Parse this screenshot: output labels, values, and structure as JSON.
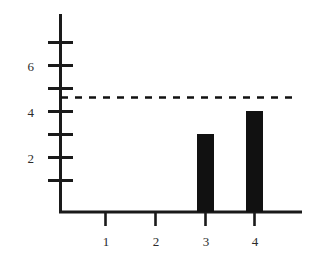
{
  "chart_data": {
    "type": "bar",
    "title": "",
    "subtitle": "",
    "xlabel": "",
    "ylabel": "",
    "categories": [
      "1",
      "2",
      "3",
      "4"
    ],
    "values": [
      6,
      7,
      3,
      4
    ],
    "series": [
      {
        "name": "",
        "values": [
          6,
          7,
          3,
          4
        ],
        "color": "#111111"
      }
    ],
    "ylim": [
      0,
      7.6
    ],
    "xlim": [
      0,
      5
    ],
    "y_ticks": [
      1,
      2,
      3,
      4,
      5,
      6,
      7
    ],
    "y_tick_labels": [
      "",
      "2",
      "",
      "4",
      "",
      "6",
      ""
    ],
    "y_labeled_ticks": [
      {
        "value": 6,
        "label": "6"
      },
      {
        "value": 4,
        "label": "4"
      },
      {
        "value": 2,
        "label": "2"
      }
    ],
    "x_tick_labels": [
      "1",
      "2",
      "3",
      "4"
    ],
    "grid": false,
    "legend": null,
    "legend_position": "none",
    "annotations": [
      {
        "type": "horizontal-reference-line",
        "value": 5,
        "style": "dashed",
        "label": "",
        "color": "#111111"
      }
    ],
    "bar_color": "#111111",
    "axis_color": "#1a1a1a",
    "background_color": "#ffffff"
  },
  "axis": {
    "y_label_6": "6",
    "y_label_4": "4",
    "y_label_2": "2",
    "x_label_1": "1",
    "x_label_2": "2",
    "x_label_3": "3",
    "x_label_4": "4"
  }
}
